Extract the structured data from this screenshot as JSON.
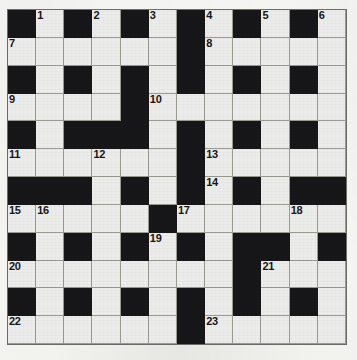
{
  "puzzle": {
    "kind": "crossword-grid",
    "columns": 12,
    "rows": 12,
    "colors": {
      "block": "#17171a",
      "cell": "#ececea",
      "paper": "#f6f6f2",
      "gridline": "#9a9a93",
      "number": "#16161a"
    },
    "legend": {
      "block_char": "#",
      "open_char": "."
    },
    "grid": [
      "#.#.#.#.#.#.",
      "......#.....",
      "#.#.#.#.#.#.",
      "....#.......",
      "#.###.#.#.#.",
      "......#.....",
      "###.#.#.#.##",
      ".....#......",
      "#.#.#.#.##.#",
      "........#...",
      "#.#.#.#.#.#.",
      "......#....."
    ],
    "numbers": [
      {
        "n": "1",
        "row": 0,
        "col": 1
      },
      {
        "n": "2",
        "row": 0,
        "col": 3
      },
      {
        "n": "3",
        "row": 0,
        "col": 5
      },
      {
        "n": "4",
        "row": 0,
        "col": 7
      },
      {
        "n": "5",
        "row": 0,
        "col": 9
      },
      {
        "n": "6",
        "row": 0,
        "col": 11
      },
      {
        "n": "7",
        "row": 1,
        "col": 0
      },
      {
        "n": "8",
        "row": 1,
        "col": 7
      },
      {
        "n": "9",
        "row": 3,
        "col": 0
      },
      {
        "n": "10",
        "row": 3,
        "col": 5
      },
      {
        "n": "11",
        "row": 5,
        "col": 0
      },
      {
        "n": "12",
        "row": 5,
        "col": 3
      },
      {
        "n": "13",
        "row": 5,
        "col": 7
      },
      {
        "n": "14",
        "row": 6,
        "col": 7
      },
      {
        "n": "15",
        "row": 7,
        "col": 0
      },
      {
        "n": "16",
        "row": 7,
        "col": 1
      },
      {
        "n": "17",
        "row": 7,
        "col": 6
      },
      {
        "n": "18",
        "row": 7,
        "col": 10
      },
      {
        "n": "19",
        "row": 8,
        "col": 5
      },
      {
        "n": "20",
        "row": 9,
        "col": 0
      },
      {
        "n": "21",
        "row": 9,
        "col": 9
      },
      {
        "n": "22",
        "row": 11,
        "col": 0
      },
      {
        "n": "23",
        "row": 11,
        "col": 7
      }
    ]
  }
}
